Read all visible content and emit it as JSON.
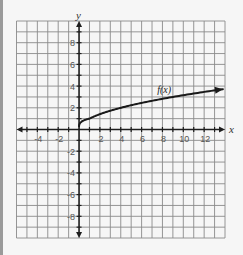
{
  "chart_data": {
    "type": "line",
    "title": "",
    "xlabel": "x",
    "ylabel": "y",
    "xlim": [
      -6,
      14
    ],
    "ylim": [
      -10,
      10
    ],
    "grid": true,
    "grid_step": 1,
    "x_tick_labels": [
      "-4",
      "-2",
      "2",
      "4",
      "6",
      "8",
      "10",
      "12"
    ],
    "x_tick_values": [
      -4,
      -2,
      2,
      4,
      6,
      8,
      10,
      12
    ],
    "y_tick_labels": [
      "8",
      "6",
      "4",
      "2",
      "-2",
      "-4",
      "-6",
      "-8"
    ],
    "y_tick_values": [
      8,
      6,
      4,
      2,
      -2,
      -4,
      -6,
      -8
    ],
    "series": [
      {
        "name": "f(x)",
        "function": "sqrt(x)",
        "domain": [
          0,
          13.8
        ],
        "x": [
          0,
          0.25,
          0.5,
          1,
          2,
          3,
          4,
          5,
          6,
          7,
          8,
          9,
          10,
          11,
          12,
          13,
          13.8
        ],
        "y": [
          0,
          0.5,
          0.71,
          1,
          1.41,
          1.73,
          2,
          2.24,
          2.45,
          2.65,
          2.83,
          3,
          3.16,
          3.32,
          3.46,
          3.61,
          3.71
        ],
        "end_arrow": true
      }
    ],
    "annotations": [
      {
        "text": "f(x)",
        "x": 7.5,
        "y": 3.4
      }
    ],
    "colors": {
      "background": "#f6f6f6",
      "grid": "#8a8a8a",
      "axes": "#1e1e1e",
      "curve": "#1a1a1a",
      "border": "#9a9a9a"
    }
  }
}
